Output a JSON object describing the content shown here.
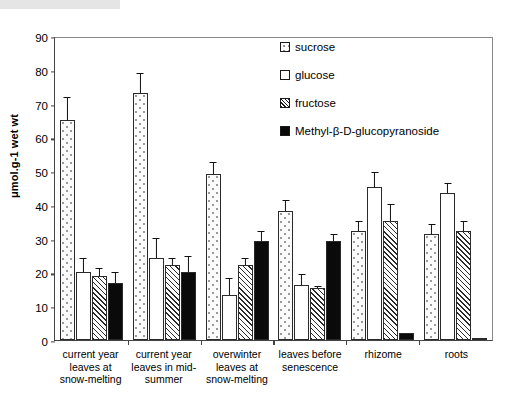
{
  "chart_data": {
    "type": "bar",
    "title": "",
    "xlabel": "",
    "ylabel": "μmol.g-1 wet wt",
    "ylim": [
      0,
      90
    ],
    "yticks": [
      0,
      10,
      20,
      30,
      40,
      50,
      60,
      70,
      80,
      90
    ],
    "grid": false,
    "legend_position": "upper right inside",
    "categories": [
      "current year leaves at snow-melting",
      "current year leaves in mid-summer",
      "overwinter leaves at snow-melting",
      "leaves before senescence",
      "rhizome",
      "roots"
    ],
    "series": [
      {
        "name": "sucrose",
        "fill": "dotted",
        "values": [
          65.0,
          73.0,
          49.2,
          38.2,
          32.3,
          31.4
        ],
        "errors": [
          7.0,
          6.2,
          3.6,
          3.4,
          2.9,
          3.0
        ]
      },
      {
        "name": "glucose",
        "fill": "white",
        "values": [
          20.1,
          24.2,
          13.2,
          16.3,
          45.4,
          43.5
        ],
        "errors": [
          4.2,
          6.0,
          5.1,
          3.2,
          4.4,
          3.1
        ]
      },
      {
        "name": "fructose",
        "fill": "hatched",
        "values": [
          19.1,
          22.2,
          22.2,
          15.3,
          35.3,
          32.3
        ],
        "errors": [
          2.3,
          2.2,
          2.1,
          0.6,
          4.9,
          3.0
        ]
      },
      {
        "name": "Methyl-β-D-glucopyranoside",
        "fill": "solid-black",
        "values": [
          17.0,
          20.2,
          29.2,
          29.3,
          2.2,
          0.5
        ],
        "errors": [
          3.1,
          4.7,
          3.1,
          2.2,
          0.0,
          0.0
        ]
      }
    ]
  },
  "legend": {
    "items": [
      {
        "label": "sucrose",
        "swatch": "dotted-square-icon"
      },
      {
        "label": "glucose",
        "swatch": "white-square-icon"
      },
      {
        "label": "fructose",
        "swatch": "hatched-square-icon"
      },
      {
        "label": "Methyl-β-D-glucopyranoside",
        "swatch": "black-square-icon"
      }
    ]
  },
  "axes": {
    "y_title": "μmol.g-1 wet wt",
    "y_tick_labels": [
      "90",
      "80",
      "70",
      "60",
      "50",
      "40",
      "30",
      "20",
      "10",
      "0"
    ]
  }
}
